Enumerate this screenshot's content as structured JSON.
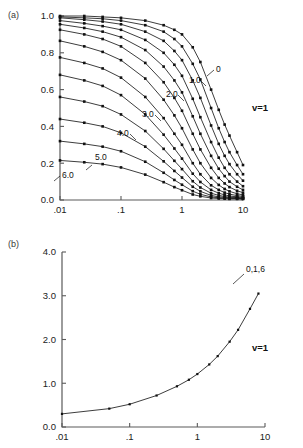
{
  "figure": {
    "panels": [
      {
        "id": "a",
        "label": "(a)",
        "annotation": "v=1",
        "axis_label_note": "0,1,6"
      },
      {
        "id": "b",
        "label": "(b)",
        "annotation": "v=1"
      }
    ]
  },
  "panel_a": {
    "label": "(a)",
    "annotation": "v=1",
    "y_ticks": [
      "0.0",
      "0.2",
      "0.4",
      "0.6",
      "0.8",
      "1.0"
    ],
    "x_ticks": [
      ".01",
      ".1",
      "1",
      "10"
    ],
    "curve_labels": [
      "0",
      "1.0",
      "2.0",
      "3.0",
      "4.0",
      "5.0",
      "6.0"
    ]
  },
  "panel_b": {
    "label": "(b)",
    "annotation": "v=1",
    "y_ticks": [
      "0.0",
      "1.0",
      "2.0",
      "3.0",
      "4.0"
    ],
    "x_ticks": [
      ".01",
      ".1",
      "1",
      "10"
    ],
    "curve_labels": [
      "0,1,6"
    ]
  },
  "chart_data": [
    {
      "type": "line",
      "panel": "a",
      "title": "",
      "xlabel": "",
      "ylabel": "",
      "xscale": "log",
      "xlim": [
        0.01,
        10
      ],
      "ylim": [
        0.0,
        1.0
      ],
      "grid": false,
      "legend": "inline-curve-labels",
      "annotations": [
        "(a)",
        "v=1"
      ],
      "xticks": [
        0.01,
        0.1,
        1,
        10
      ],
      "xticklabels": [
        ".01",
        ".1",
        "1",
        "10"
      ],
      "yticks": [
        0.0,
        0.2,
        0.4,
        0.6,
        0.8,
        1.0
      ],
      "yticklabels": [
        "0.0",
        "0.2",
        "0.4",
        "0.6",
        "0.8",
        "1.0"
      ],
      "x": [
        0.01,
        0.025,
        0.05,
        0.1,
        0.25,
        0.5,
        0.75,
        1.0,
        1.5,
        2.0,
        3.0,
        4.0,
        5.0,
        6.0,
        8.0,
        10.0
      ],
      "series": [
        {
          "name": "0",
          "label": "0",
          "values": [
            1.0,
            1.0,
            0.995,
            0.99,
            0.975,
            0.95,
            0.925,
            0.9,
            0.83,
            0.75,
            0.6,
            0.49,
            0.41,
            0.35,
            0.26,
            0.19
          ]
        },
        {
          "name": "0.5",
          "label": "",
          "values": [
            0.995,
            0.99,
            0.985,
            0.975,
            0.95,
            0.915,
            0.875,
            0.835,
            0.74,
            0.655,
            0.5,
            0.39,
            0.315,
            0.26,
            0.19,
            0.14
          ]
        },
        {
          "name": "1.0",
          "label": "1.0",
          "values": [
            0.99,
            0.98,
            0.97,
            0.955,
            0.915,
            0.865,
            0.81,
            0.76,
            0.65,
            0.555,
            0.405,
            0.305,
            0.24,
            0.195,
            0.14,
            0.105
          ]
        },
        {
          "name": "1.5",
          "label": "",
          "values": [
            0.975,
            0.96,
            0.945,
            0.925,
            0.87,
            0.8,
            0.735,
            0.675,
            0.55,
            0.45,
            0.315,
            0.23,
            0.175,
            0.14,
            0.1,
            0.075
          ]
        },
        {
          "name": "2.0",
          "label": "2.0",
          "values": [
            0.955,
            0.935,
            0.915,
            0.885,
            0.815,
            0.725,
            0.65,
            0.585,
            0.455,
            0.36,
            0.24,
            0.17,
            0.13,
            0.1,
            0.072,
            0.055
          ]
        },
        {
          "name": "2.5",
          "label": "",
          "values": [
            0.925,
            0.9,
            0.875,
            0.835,
            0.745,
            0.64,
            0.555,
            0.485,
            0.36,
            0.275,
            0.175,
            0.12,
            0.09,
            0.07,
            0.05,
            0.04
          ]
        },
        {
          "name": "3.0",
          "label": "3.0",
          "values": [
            0.865,
            0.835,
            0.805,
            0.76,
            0.66,
            0.545,
            0.46,
            0.39,
            0.275,
            0.2,
            0.12,
            0.082,
            0.06,
            0.047,
            0.034,
            0.028
          ]
        },
        {
          "name": "3.5",
          "label": "",
          "values": [
            0.775,
            0.745,
            0.715,
            0.665,
            0.56,
            0.445,
            0.36,
            0.3,
            0.2,
            0.14,
            0.08,
            0.055,
            0.04,
            0.032,
            0.024,
            0.02
          ]
        },
        {
          "name": "4.0",
          "label": "4.0",
          "values": [
            0.68,
            0.65,
            0.62,
            0.57,
            0.465,
            0.355,
            0.28,
            0.225,
            0.143,
            0.098,
            0.055,
            0.037,
            0.028,
            0.022,
            0.017,
            0.015
          ]
        },
        {
          "name": "4.5",
          "label": "",
          "values": [
            0.56,
            0.535,
            0.51,
            0.465,
            0.375,
            0.278,
            0.213,
            0.168,
            0.102,
            0.068,
            0.037,
            0.025,
            0.019,
            0.016,
            0.013,
            0.011
          ]
        },
        {
          "name": "5.0",
          "label": "5.0",
          "values": [
            0.44,
            0.42,
            0.4,
            0.365,
            0.29,
            0.21,
            0.158,
            0.122,
            0.072,
            0.047,
            0.025,
            0.017,
            0.014,
            0.012,
            0.01,
            0.009
          ]
        },
        {
          "name": "5.5",
          "label": "",
          "values": [
            0.32,
            0.305,
            0.29,
            0.265,
            0.208,
            0.148,
            0.109,
            0.083,
            0.048,
            0.031,
            0.017,
            0.012,
            0.01,
            0.009,
            0.008,
            0.007
          ]
        },
        {
          "name": "6.0",
          "label": "6.0",
          "values": [
            0.215,
            0.205,
            0.195,
            0.177,
            0.138,
            0.097,
            0.07,
            0.053,
            0.03,
            0.02,
            0.011,
            0.008,
            0.007,
            0.006,
            0.006,
            0.005
          ]
        }
      ]
    },
    {
      "type": "line",
      "panel": "b",
      "title": "",
      "xlabel": "",
      "ylabel": "",
      "xscale": "log",
      "xlim": [
        0.01,
        10
      ],
      "ylim": [
        0.0,
        4.0
      ],
      "grid": false,
      "legend": "inline-curve-labels",
      "annotations": [
        "(b)",
        "v=1",
        "0,1,6"
      ],
      "xticks": [
        0.01,
        0.1,
        1,
        10
      ],
      "xticklabels": [
        ".01",
        ".1",
        "1",
        "10"
      ],
      "yticks": [
        0.0,
        1.0,
        2.0,
        3.0,
        4.0
      ],
      "yticklabels": [
        "0.0",
        "1.0",
        "2.0",
        "3.0",
        "4.0"
      ],
      "x": [
        0.01,
        0.05,
        0.1,
        0.25,
        0.5,
        0.75,
        1.0,
        1.5,
        2.0,
        3.0,
        4.0,
        6.0,
        8.0
      ],
      "series": [
        {
          "name": "0,1,6",
          "label": "0,1,6",
          "values": [
            0.3,
            0.42,
            0.52,
            0.72,
            0.93,
            1.08,
            1.21,
            1.43,
            1.62,
            1.95,
            2.22,
            2.7,
            3.05
          ]
        }
      ]
    }
  ]
}
